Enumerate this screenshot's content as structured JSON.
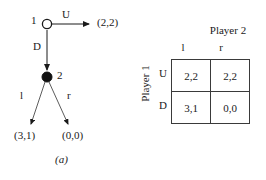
{
  "figure": {
    "panel_a": {
      "caption": "(a)",
      "nodes": [
        {
          "id": "root",
          "player_label": "1",
          "type": "hollow-circle"
        },
        {
          "id": "node2",
          "player_label": "2",
          "type": "filled-circle"
        }
      ],
      "actions": {
        "root_up": "U",
        "root_down": "D",
        "node2_left": "l",
        "node2_right": "r"
      },
      "payoffs": {
        "up": "(2,2)",
        "down_left": "(3,1)",
        "down_right": "(0,0)"
      }
    },
    "panel_b": {
      "caption": "(b)",
      "column_player": "Player 2",
      "row_player": "Player 1",
      "column_labels": [
        "l",
        "r"
      ],
      "row_labels": [
        "U",
        "D"
      ],
      "cells": [
        [
          "2,2",
          "2,2"
        ],
        [
          "3,1",
          "0,0"
        ]
      ]
    },
    "colors": {
      "ink": "#1a1a1a",
      "rule": "#3a3a3a",
      "background": "#ffffff"
    }
  }
}
